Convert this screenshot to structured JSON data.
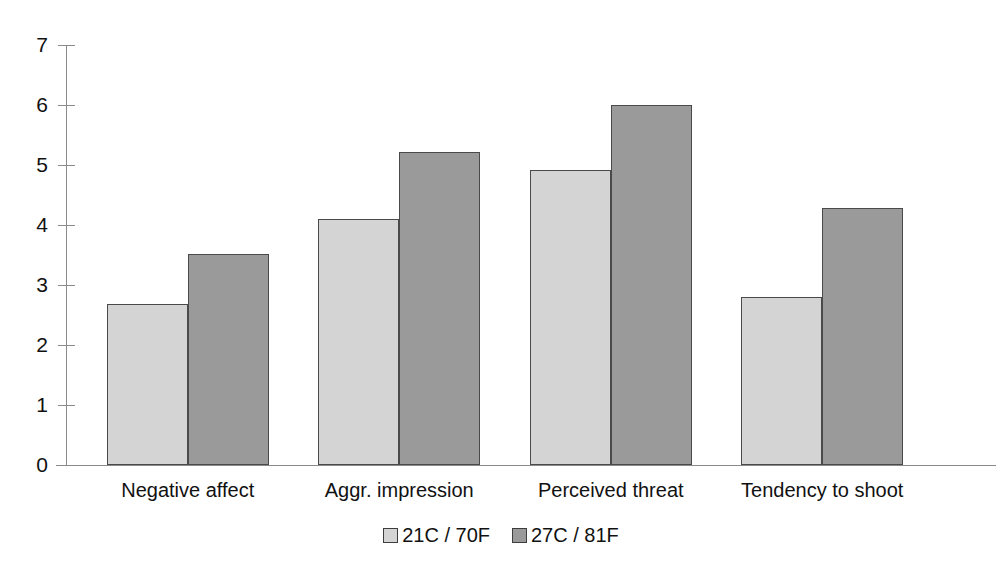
{
  "chart_data": {
    "type": "bar",
    "title": "",
    "subtitle": "",
    "xlabel": "",
    "ylabel": "",
    "categories": [
      "Negative affect",
      "Aggr. impression",
      "Perceived threat",
      "Tendency to shoot"
    ],
    "series": [
      {
        "name": "21C / 70F",
        "color": "#d4d4d4",
        "values": [
          2.68,
          4.1,
          4.92,
          2.8
        ]
      },
      {
        "name": "27C / 81F",
        "color": "#9a9a9a",
        "values": [
          3.52,
          5.22,
          6.0,
          4.28
        ]
      }
    ],
    "ylim": [
      0,
      7
    ],
    "ytick_labels": [
      "0",
      "1",
      "2",
      "3",
      "4",
      "5",
      "6",
      "7"
    ],
    "ytick_values": [
      0,
      1,
      2,
      3,
      4,
      5,
      6,
      7
    ],
    "grid": false,
    "legend_position": "bottom",
    "annotations": []
  },
  "axes": {
    "y_axis_color": "#8a8a8a",
    "x_axis_color": "#8a8a8a"
  }
}
